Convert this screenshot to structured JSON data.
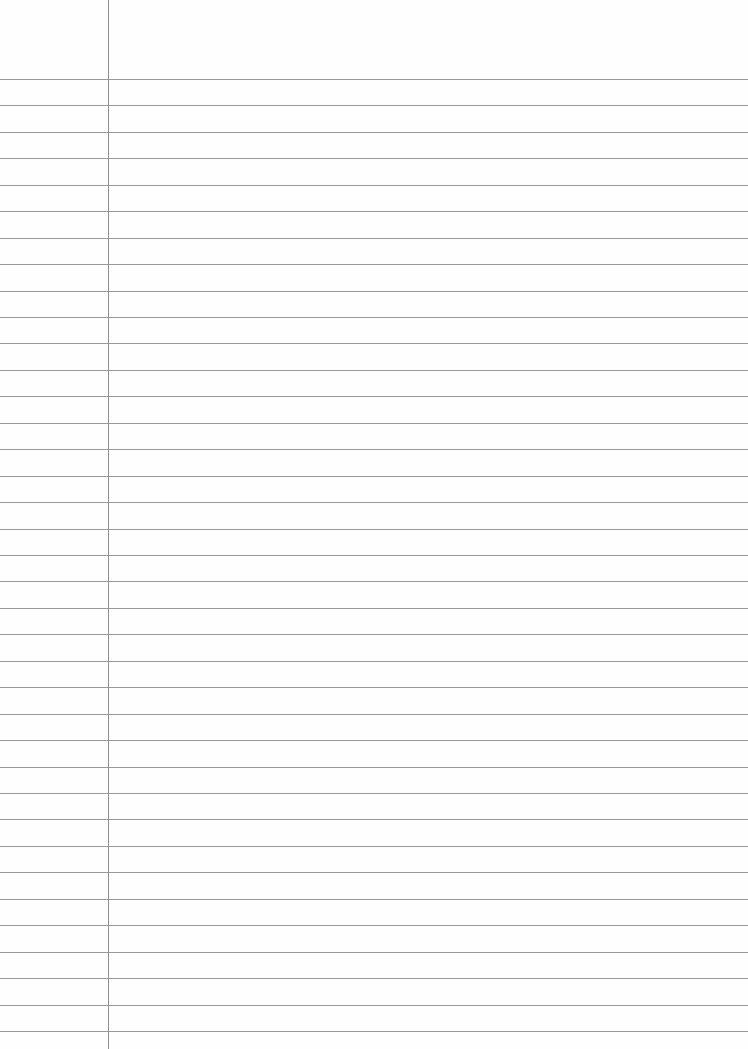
{
  "page": {
    "type": "lined-paper",
    "width": 748,
    "height": 1049,
    "background_color": "#fefefe",
    "text": ""
  },
  "rules": {
    "count": 37,
    "first_y": 79,
    "last_y": 1031,
    "spacing": 26.44,
    "color": "#9a9a9a"
  },
  "margin": {
    "x": 108,
    "color": "#8f8f8f"
  }
}
